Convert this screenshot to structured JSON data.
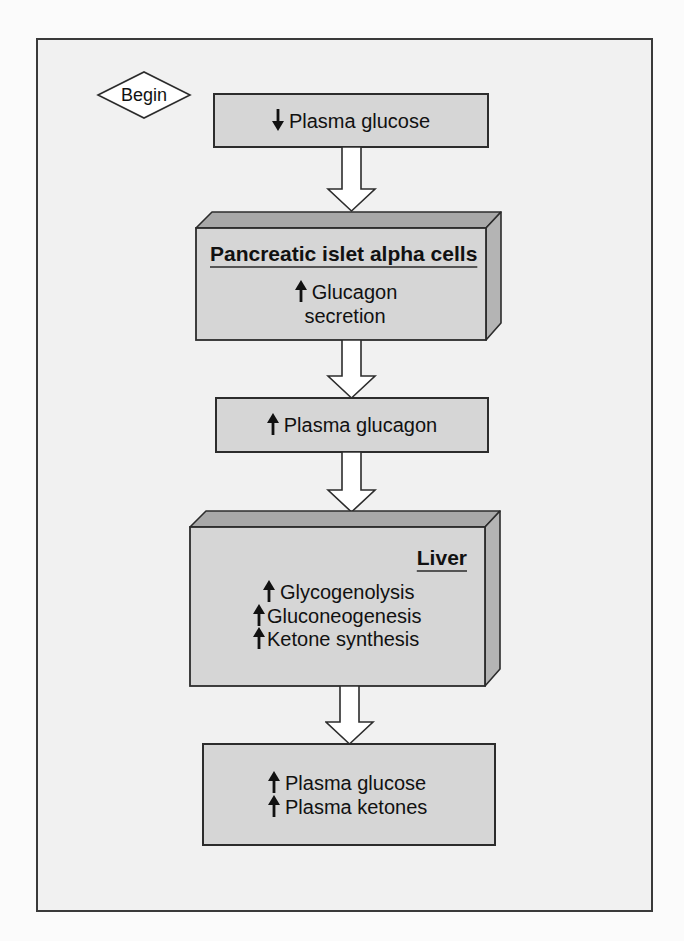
{
  "diagram": {
    "title": "",
    "type": "flowchart",
    "start": {
      "label": "Begin"
    },
    "colors": {
      "page_background": "#f1f1f1",
      "box_front": "#d6d6d6",
      "box_top": "#a8a8a8",
      "box_side": "#b4b4b4",
      "outline": "#2c2c2c",
      "arrow_fill": "#ffffff"
    },
    "nodes": [
      {
        "id": "plasma-glucose-low",
        "style": "flat",
        "lines": [
          {
            "direction": "down",
            "arrow_icon": "down-arrow",
            "text": "Plasma glucose"
          }
        ]
      },
      {
        "id": "alpha-cells",
        "style": "3d",
        "heading": "Pancreatic islet alpha cells",
        "lines": [
          {
            "direction": "up",
            "arrow_icon": "up-arrow",
            "text": "Glucagon"
          },
          {
            "direction": "none",
            "text": "secretion"
          }
        ]
      },
      {
        "id": "plasma-glucagon",
        "style": "flat",
        "lines": [
          {
            "direction": "up",
            "arrow_icon": "up-arrow",
            "text": "Plasma glucagon"
          }
        ]
      },
      {
        "id": "liver",
        "style": "3d",
        "heading": "Liver",
        "lines": [
          {
            "direction": "up",
            "arrow_icon": "up-arrow",
            "text": "Glycogenolysis"
          },
          {
            "direction": "up",
            "arrow_icon": "up-arrow",
            "text": "Gluconeogenesis"
          },
          {
            "direction": "up",
            "arrow_icon": "up-arrow",
            "text": "Ketone synthesis"
          }
        ]
      },
      {
        "id": "plasma-result",
        "style": "flat",
        "lines": [
          {
            "direction": "up",
            "arrow_icon": "up-arrow",
            "text": "Plasma glucose"
          },
          {
            "direction": "up",
            "arrow_icon": "up-arrow",
            "text": "Plasma ketones"
          }
        ]
      }
    ],
    "edges": [
      {
        "from": "plasma-glucose-low",
        "to": "alpha-cells"
      },
      {
        "from": "alpha-cells",
        "to": "plasma-glucagon"
      },
      {
        "from": "plasma-glucagon",
        "to": "liver"
      },
      {
        "from": "liver",
        "to": "plasma-result"
      }
    ]
  }
}
